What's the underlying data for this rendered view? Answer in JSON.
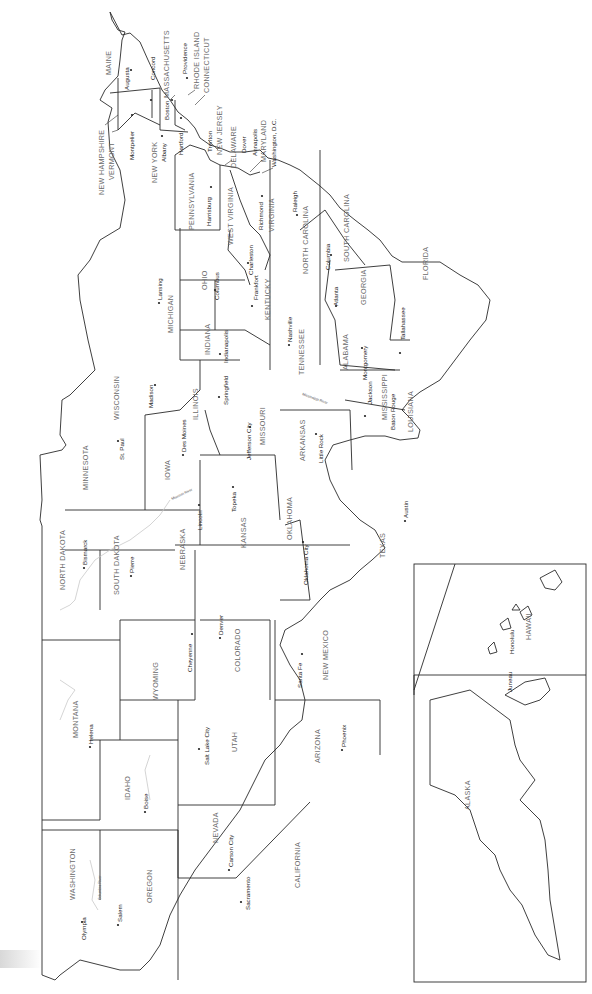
{
  "map": {
    "title": "United States — States and Capitals",
    "orientation": "rotated 90° (north faces left)",
    "states": [
      {
        "name": "MAINE"
      },
      {
        "name": "NEW HAMPSHIRE"
      },
      {
        "name": "VERMONT"
      },
      {
        "name": "MASSACHUSETTS"
      },
      {
        "name": "RHODE ISLAND"
      },
      {
        "name": "CONNECTICUT"
      },
      {
        "name": "NEW YORK"
      },
      {
        "name": "NEW JERSEY"
      },
      {
        "name": "DELAWARE"
      },
      {
        "name": "MARYLAND"
      },
      {
        "name": "PENNSYLVANIA"
      },
      {
        "name": "WEST VIRGINIA"
      },
      {
        "name": "VIRGINIA"
      },
      {
        "name": "NORTH CAROLINA"
      },
      {
        "name": "SOUTH CAROLINA"
      },
      {
        "name": "GEORGIA"
      },
      {
        "name": "FLORIDA"
      },
      {
        "name": "ALABAMA"
      },
      {
        "name": "MISSISSIPPI"
      },
      {
        "name": "TENNESSEE"
      },
      {
        "name": "KENTUCKY"
      },
      {
        "name": "OHIO"
      },
      {
        "name": "MICHIGAN"
      },
      {
        "name": "INDIANA"
      },
      {
        "name": "ILLINOIS"
      },
      {
        "name": "WISCONSIN"
      },
      {
        "name": "MINNESOTA"
      },
      {
        "name": "IOWA"
      },
      {
        "name": "MISSOURI"
      },
      {
        "name": "ARKANSAS"
      },
      {
        "name": "LOUISIANA"
      },
      {
        "name": "TEXAS"
      },
      {
        "name": "OKLAHOMA"
      },
      {
        "name": "KANSAS"
      },
      {
        "name": "NEBRASKA"
      },
      {
        "name": "SOUTH DAKOTA"
      },
      {
        "name": "NORTH DAKOTA"
      },
      {
        "name": "MONTANA"
      },
      {
        "name": "WYOMING"
      },
      {
        "name": "COLORADO"
      },
      {
        "name": "NEW MEXICO"
      },
      {
        "name": "ARIZONA"
      },
      {
        "name": "UTAH"
      },
      {
        "name": "IDAHO"
      },
      {
        "name": "NEVADA"
      },
      {
        "name": "WASHINGTON"
      },
      {
        "name": "OREGON"
      },
      {
        "name": "CALIFORNIA"
      },
      {
        "name": "ALASKA"
      },
      {
        "name": "HAWAII"
      }
    ],
    "capitals": [
      "Augusta",
      "Concord",
      "Montpelier",
      "Boston",
      "Providence",
      "Hartford",
      "Albany",
      "Trenton",
      "Dover",
      "Annapolis",
      "Washington, D.C.",
      "Harrisburg",
      "Charleston",
      "Richmond",
      "Raleigh",
      "Columbia",
      "Atlanta",
      "Tallahassee",
      "Montgomery",
      "Jackson",
      "Nashville",
      "Frankfort",
      "Columbus",
      "Lansing",
      "Indianapolis",
      "Springfield",
      "Madison",
      "St. Paul",
      "Des Moines",
      "Jefferson City",
      "Little Rock",
      "Baton Rouge",
      "Austin",
      "Oklahoma City",
      "Topeka",
      "Lincoln",
      "Pierre",
      "Bismarck",
      "Helena",
      "Cheyenne",
      "Denver",
      "Santa Fe",
      "Phoenix",
      "Salt Lake City",
      "Boise",
      "Carson City",
      "Olympia",
      "Salem",
      "Sacramento",
      "Juneau",
      "Honolulu"
    ],
    "rivers": [
      "Mississippi River",
      "Missouri River",
      "Columbia River"
    ]
  }
}
